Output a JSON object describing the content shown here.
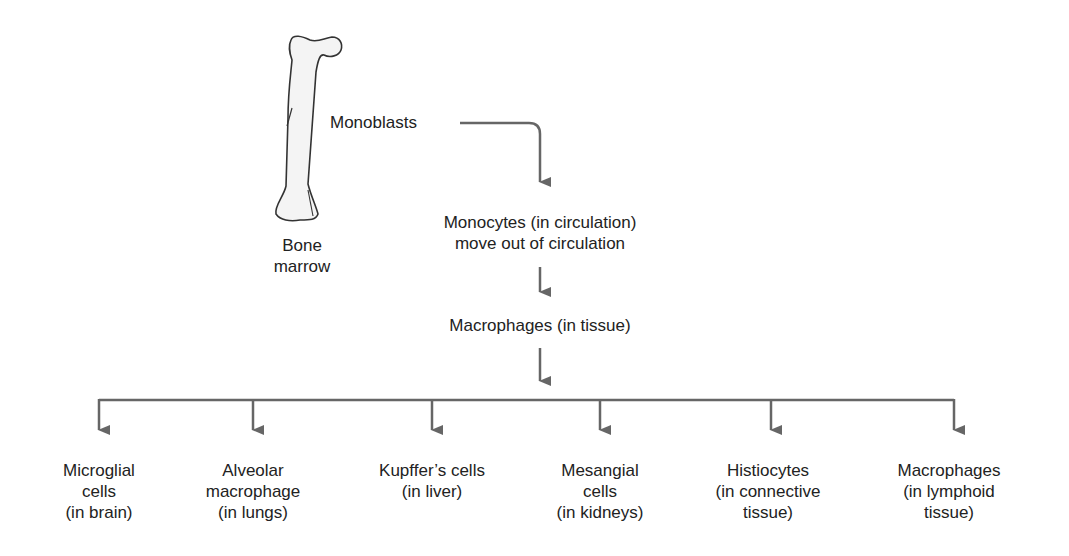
{
  "diagram": {
    "type": "flowchart",
    "colors": {
      "arrow": "#666666",
      "text": "#222222",
      "bone_fill": "#f4f4f4",
      "bone_outline": "#333333"
    },
    "source": {
      "icon": "bone-icon",
      "label_line1": "Bone",
      "label_line2": "marrow"
    },
    "nodes": {
      "monoblasts": "Monoblasts",
      "monocytes_line1": "Monocytes (in circulation)",
      "monocytes_line2": "move out of circulation",
      "macrophages_tissue": "Macrophages (in tissue)"
    },
    "branches": [
      {
        "lines": [
          "Microglial",
          "cells",
          "(in brain)"
        ]
      },
      {
        "lines": [
          "Alveolar",
          "macrophage",
          "(in lungs)"
        ]
      },
      {
        "lines": [
          "Kupffer’s cells",
          "(in liver)"
        ]
      },
      {
        "lines": [
          "Mesangial",
          "cells",
          "(in kidneys)"
        ]
      },
      {
        "lines": [
          "Histiocytes",
          "(in connective",
          "tissue)"
        ]
      },
      {
        "lines": [
          "Macrophages",
          "(in lymphoid",
          "tissue)"
        ]
      }
    ],
    "edges": [
      [
        "Bone marrow",
        "Monoblasts"
      ],
      [
        "Monoblasts",
        "Monocytes (in circulation)"
      ],
      [
        "Monocytes (in circulation)",
        "Macrophages (in tissue)"
      ],
      [
        "Macrophages (in tissue)",
        "Microglial cells"
      ],
      [
        "Macrophages (in tissue)",
        "Alveolar macrophage"
      ],
      [
        "Macrophages (in tissue)",
        "Kupffer's cells"
      ],
      [
        "Macrophages (in tissue)",
        "Mesangial cells"
      ],
      [
        "Macrophages (in tissue)",
        "Histiocytes"
      ],
      [
        "Macrophages (in tissue)",
        "Macrophages (in lymphoid tissue)"
      ]
    ]
  }
}
